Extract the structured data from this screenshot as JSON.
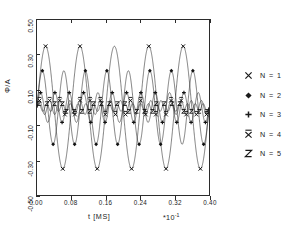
{
  "chart_data": {
    "type": "line",
    "title": "",
    "xlabel": "t  [MS]",
    "x_exponent_prefix": "*10",
    "x_exponent_power": "-1",
    "ylabel": "Φ/A",
    "xlim": [
      0.0,
      0.4
    ],
    "ylim": [
      -0.5,
      0.5
    ],
    "grid": false,
    "legend_position": "right-outside",
    "x_ticks": [
      "0.00",
      "0.08",
      "0.16",
      "0.24",
      "0.32",
      "0.40"
    ],
    "x_tick_values": [
      0.0,
      0.08,
      0.16,
      0.24,
      0.32,
      0.4
    ],
    "y_ticks": [
      "0.50",
      "0.30",
      "0.10",
      "-0.10",
      "-0.30",
      "-0.50"
    ],
    "y_tick_values": [
      0.5,
      0.3,
      0.1,
      -0.1,
      -0.3,
      -0.5
    ],
    "series": [
      {
        "name": "N = 1",
        "marker": "cross-x",
        "amplitude": 0.35,
        "cycles": 5.0,
        "phase": 0.0,
        "marker_count": 9
      },
      {
        "name": "N = 2",
        "marker": "diamond",
        "amplitude": 0.21,
        "cycles": 8.0,
        "phase": 0.0,
        "marker_count": 13
      },
      {
        "name": "N = 3",
        "marker": "plus",
        "amplitude": 0.085,
        "cycles": 12.0,
        "phase": 0.0,
        "marker_count": 17
      },
      {
        "name": "N = 4",
        "marker": "x-bar",
        "amplitude": 0.04,
        "cycles": 17.0,
        "phase": 0.0,
        "marker_count": 21
      },
      {
        "name": "N = 5",
        "marker": "z",
        "amplitude": 0.022,
        "cycles": 22.0,
        "phase": 0.0,
        "marker_count": 25
      }
    ],
    "legend_entries": [
      {
        "marker": "cross-x",
        "label": "N = 1"
      },
      {
        "marker": "diamond",
        "label": "N = 2"
      },
      {
        "marker": "plus",
        "label": "N = 3"
      },
      {
        "marker": "x-bar",
        "label": "N = 4"
      },
      {
        "marker": "z",
        "label": "N = 5"
      }
    ]
  }
}
